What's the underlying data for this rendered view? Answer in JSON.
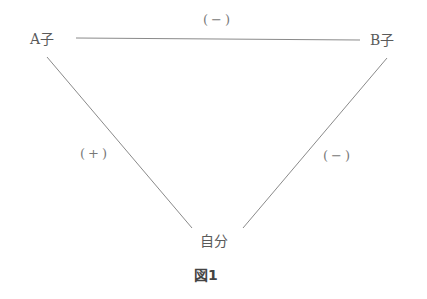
{
  "nodes": {
    "a": {
      "label": "A子"
    },
    "b": {
      "label": "B子"
    },
    "self": {
      "label": "自分"
    }
  },
  "edges": {
    "a_b": {
      "sign": "(−)"
    },
    "a_self": {
      "sign": "(+)"
    },
    "b_self": {
      "sign": "(−)"
    }
  },
  "caption": "図1",
  "colors": {
    "line": "#8a8a8a",
    "text": "#5a5a5a"
  }
}
